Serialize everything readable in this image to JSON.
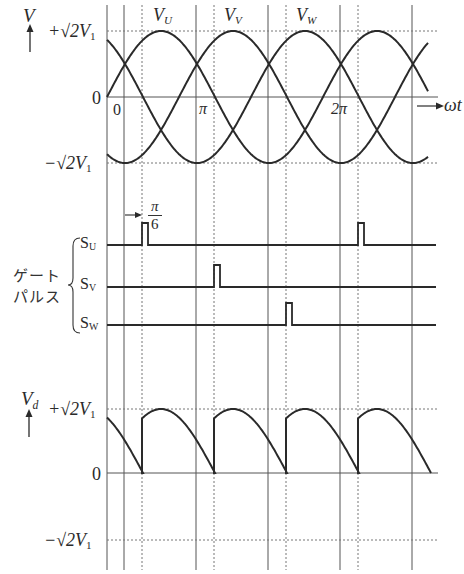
{
  "figure": {
    "title": "",
    "colors": {
      "ink": "#2a2a2a",
      "grid": "#555555",
      "dotted": "#777777",
      "background": "#ffffff"
    }
  },
  "top_panel": {
    "y_axis_label": "V",
    "y_axis_arrow": "up-arrow",
    "tick_pos": "+√2V",
    "tick_pos_sub": "1",
    "tick_zero": "0",
    "tick_neg": "−√2V",
    "tick_neg_sub": "1",
    "x_axis_label": "ωt",
    "x_ticks": [
      {
        "label": "0"
      },
      {
        "label": "π"
      },
      {
        "label": "2π"
      }
    ],
    "curve_labels": [
      {
        "base": "V",
        "sub": "U"
      },
      {
        "base": "V",
        "sub": "V"
      },
      {
        "base": "V",
        "sub": "W"
      }
    ]
  },
  "gate_panel": {
    "group_label_line1": "ゲート",
    "group_label_line2": "パルス",
    "delay_label_num": "π",
    "delay_label_den": "6",
    "signals": [
      {
        "base": "S",
        "sub": "U"
      },
      {
        "base": "S",
        "sub": "V"
      },
      {
        "base": "S",
        "sub": "W"
      }
    ]
  },
  "bottom_panel": {
    "y_axis_label": "V",
    "y_axis_sub": "d",
    "tick_pos": "+√2V",
    "tick_pos_sub": "1",
    "tick_zero": "0",
    "tick_neg": "−√2V",
    "tick_neg_sub": "1"
  },
  "chart_data": [
    {
      "type": "line",
      "title": "Three-phase source voltages",
      "xlabel": "ωt",
      "ylabel": "V",
      "x_ticks": [
        "0",
        "π",
        "2π"
      ],
      "y_ticks": [
        "+√2V1",
        "0",
        "−√2V1"
      ],
      "ylim": [
        "-√2V1",
        "+√2V1"
      ],
      "series": [
        {
          "name": "V_U",
          "expr": "√2V1·sin(ωt)"
        },
        {
          "name": "V_V",
          "expr": "√2V1·sin(ωt − 2π/3)"
        },
        {
          "name": "V_W",
          "expr": "√2V1·sin(ωt − 4π/3)"
        }
      ],
      "grid": "vertical lines every π/3 (solid) plus dotted firing lines; dotted lines at ±√2V1"
    },
    {
      "type": "line",
      "title": "Gate pulses",
      "series": [
        {
          "name": "S_U",
          "pulse_positions": [
            "firing angle α after natural commutation point (π/6 delay shown)",
            "one period later"
          ]
        },
        {
          "name": "S_V",
          "pulse_positions": [
            "S_U + 2π/3"
          ]
        },
        {
          "name": "S_W",
          "pulse_positions": [
            "S_U + 4π/3"
          ]
        }
      ],
      "annotations": [
        "π/6 delay arrow from commutation point to S_U pulse"
      ]
    },
    {
      "type": "line",
      "title": "Output DC voltage",
      "ylabel": "V_d",
      "y_ticks": [
        "+√2V1",
        "0",
        "−√2V1"
      ],
      "series": [
        {
          "name": "V_d",
          "description": "Half-wave 3-pulse controlled rectifier output; each phase conducts from its gate pulse until next gate pulse, falling to 0 at each switching instant (resistive load)"
        }
      ]
    }
  ]
}
